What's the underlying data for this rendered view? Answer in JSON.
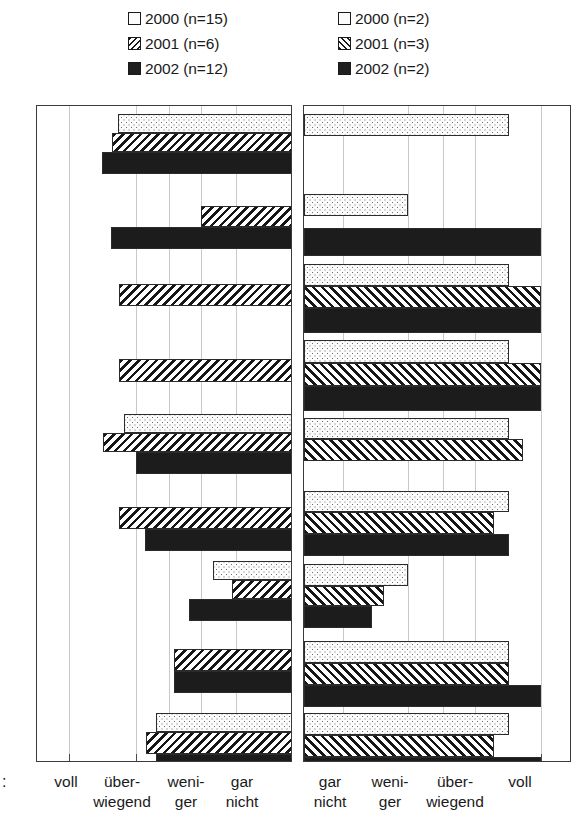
{
  "legend": {
    "left": [
      {
        "label": "2000 (n=15)",
        "pattern": "dotted"
      },
      {
        "label": "2001 (n=6)",
        "pattern": "hatch-left"
      },
      {
        "label": "2002 (n=12)",
        "pattern": "solid-black"
      }
    ],
    "right": [
      {
        "label": "2000 (n=2)",
        "pattern": "dotted"
      },
      {
        "label": "2001 (n=3)",
        "pattern": "hatch-right"
      },
      {
        "label": "2002 (n=2)",
        "pattern": "solid-black"
      }
    ]
  },
  "row_marker": ":",
  "axis": {
    "left_panel_labels": [
      {
        "line1": "voll",
        "line2": ""
      },
      {
        "line1": "über-",
        "line2": "wiegend"
      },
      {
        "line1": "weni-",
        "line2": "ger"
      },
      {
        "line1": "gar",
        "line2": "nicht"
      }
    ],
    "right_panel_labels": [
      {
        "line1": "gar",
        "line2": "nicht"
      },
      {
        "line1": "weni-",
        "line2": "ger"
      },
      {
        "line1": "über-",
        "line2": "wiegend"
      },
      {
        "line1": "voll",
        "line2": ""
      }
    ]
  },
  "colors": {
    "frame": "#3a3a3a",
    "gridline": "#c9c9c9",
    "bar_outline": "#2b2b2b",
    "solid_fill": "#1c1c1c",
    "background": "#ffffff"
  },
  "chart_data": {
    "type": "bar",
    "title": "",
    "subtitle": "",
    "xlabel": "",
    "ylabel": "",
    "orientation": "horizontal",
    "grid": true,
    "legend_position": "top",
    "panels": [
      {
        "name": "left-panel",
        "direction": "right-to-left",
        "scale_categories": [
          "voll",
          "überwiegend",
          "weniger",
          "gar nicht"
        ],
        "xlim": [
          0,
          4
        ],
        "note": "Bars anchored at right edge (value 4 = 'gar nicht' side); longer bar = value closer to 'voll'.",
        "series": [
          {
            "name": "2000 (n=15)",
            "pattern": "dotted",
            "values": [
              2.65,
              null,
              null,
              null,
              2.95,
              2.55,
              1.55,
              null,
              2.45
            ]
          },
          {
            "name": "2001 (n=6)",
            "pattern": "hatch-left",
            "values": [
              2.8,
              3.1,
              2.75,
              2.7,
              3.15,
              2.85,
              1.8,
              2.4,
              2.6
            ]
          },
          {
            "name": "2002 (n=12)",
            "pattern": "solid-black",
            "values": [
              3.0,
              2.55,
              null,
              null,
              2.55,
              2.7,
              2.1,
              2.5,
              2.6
            ]
          }
        ]
      },
      {
        "name": "right-panel",
        "direction": "left-to-right",
        "scale_categories": [
          "gar nicht",
          "weniger",
          "überwiegend",
          "voll"
        ],
        "xlim": [
          0,
          4
        ],
        "note": "Bars anchored at left edge (value 0 = 'gar nicht'); longer bar = value closer to 'voll'.",
        "series": [
          {
            "name": "2000 (n=2)",
            "pattern": "dotted",
            "values": [
              3.05,
              1.55,
              3.05,
              3.05,
              3.05,
              3.05,
              0.4,
              3.2,
              3.05
            ]
          },
          {
            "name": "2001 (n=3)",
            "pattern": "hatch-right",
            "values": [
              null,
              null,
              3.75,
              3.75,
              3.3,
              2.85,
              0.9,
              3.05,
              2.9
            ]
          },
          {
            "name": "2002 (n=2)",
            "pattern": "solid-black",
            "values": [
              null,
              3.75,
              3.75,
              3.7,
              null,
              3.05,
              0.75,
              3.85,
              3.8
            ]
          }
        ]
      }
    ],
    "group_count": 9
  },
  "geometry": {
    "left_panel": {
      "x": 36,
      "y": 105,
      "w": 256,
      "h": 657,
      "gridlines": [
        32,
        99,
        132,
        164,
        199
      ],
      "ticks": [
        32,
        99,
        132,
        164,
        199,
        231
      ]
    },
    "right_panel": {
      "x": 303,
      "y": 105,
      "w": 268,
      "h": 657,
      "gridlines": [
        39,
        104,
        139,
        171,
        237
      ],
      "ticks": [
        39,
        72,
        104,
        139,
        171,
        237
      ]
    },
    "left_bars": [
      {
        "y": 8,
        "h": 19,
        "x": 81,
        "w": 174,
        "p": "dot"
      },
      {
        "y": 27,
        "h": 19,
        "x": 75,
        "w": 180,
        "p": "hatchL"
      },
      {
        "y": 46,
        "h": 22,
        "x": 65,
        "w": 190,
        "p": "solid"
      },
      {
        "y": 100,
        "h": 21,
        "x": 164,
        "w": 91,
        "p": "hatchL",
        "shift": true
      },
      {
        "y": 121,
        "h": 22,
        "x": 74,
        "w": 181,
        "p": "solid",
        "note": "start x=74"
      },
      {
        "y": 178,
        "h": 22,
        "x": 82,
        "w": 173,
        "p": "hatchL"
      },
      {
        "y": 253,
        "h": 23,
        "x": 82,
        "w": 173,
        "p": "hatchL"
      },
      {
        "y": 308,
        "h": 19,
        "x": 87,
        "w": 168,
        "p": "dot"
      },
      {
        "y": 327,
        "h": 19,
        "x": 66,
        "w": 189,
        "p": "hatchL"
      },
      {
        "y": 346,
        "h": 22,
        "x": 99,
        "w": 156,
        "p": "solid"
      },
      {
        "y": 401,
        "h": 22,
        "x": 82,
        "w": 173,
        "p": "hatchL"
      },
      {
        "y": 423,
        "h": 22,
        "x": 108,
        "w": 147,
        "p": "solid"
      },
      {
        "y": 455,
        "h": 19,
        "x": 176,
        "w": 79,
        "p": "dot"
      },
      {
        "y": 474,
        "h": 19,
        "x": 195,
        "w": 60,
        "p": "hatchL"
      },
      {
        "y": 493,
        "h": 22,
        "x": 152,
        "w": 103,
        "p": "solid"
      },
      {
        "y": 543,
        "h": 22,
        "x": 137,
        "w": 118,
        "p": "hatchL"
      },
      {
        "y": 565,
        "h": 22,
        "x": 137,
        "w": 118,
        "p": "solid"
      },
      {
        "y": 607,
        "h": 19,
        "x": 119,
        "w": 136,
        "p": "dot"
      },
      {
        "y": 626,
        "h": 22,
        "x": 109,
        "w": 146,
        "p": "hatchL"
      },
      {
        "y": 648,
        "h": 22,
        "x": 119,
        "w": 136,
        "p": "solid"
      }
    ],
    "right_bars": [
      {
        "y": 8,
        "h": 22,
        "x": 0,
        "w": 205,
        "p": "dot"
      },
      {
        "y": 88,
        "h": 22,
        "x": 0,
        "w": 104,
        "p": "dot"
      },
      {
        "y": 122,
        "h": 28,
        "x": 0,
        "w": 237,
        "p": "solid"
      },
      {
        "y": 158,
        "h": 22,
        "x": 0,
        "w": 205,
        "p": "dot"
      },
      {
        "y": 180,
        "h": 22,
        "x": 0,
        "w": 237,
        "p": "hatchR"
      },
      {
        "y": 202,
        "h": 25,
        "x": 0,
        "w": 237,
        "p": "solid"
      },
      {
        "y": 234,
        "h": 23,
        "x": 0,
        "w": 205,
        "p": "dot"
      },
      {
        "y": 257,
        "h": 23,
        "x": 0,
        "w": 237,
        "p": "hatchR"
      },
      {
        "y": 280,
        "h": 25,
        "x": 0,
        "w": 237,
        "p": "solid"
      },
      {
        "y": 312,
        "h": 21,
        "x": 0,
        "w": 205,
        "p": "dot"
      },
      {
        "y": 333,
        "h": 22,
        "x": 0,
        "w": 219,
        "p": "hatchR"
      },
      {
        "y": 385,
        "h": 21,
        "x": 0,
        "w": 205,
        "p": "dot"
      },
      {
        "y": 406,
        "h": 22,
        "x": 0,
        "w": 190,
        "p": "hatchR"
      },
      {
        "y": 428,
        "h": 22,
        "x": 0,
        "w": 205,
        "p": "solid"
      },
      {
        "y": 458,
        "h": 22,
        "x": 0,
        "w": 104,
        "p": "dot"
      },
      {
        "y": 480,
        "h": 20,
        "x": 0,
        "w": 80,
        "p": "hatchR"
      },
      {
        "y": 500,
        "h": 22,
        "x": 0,
        "w": 68,
        "p": "solid"
      },
      {
        "y": 535,
        "h": 22,
        "x": 0,
        "w": 205,
        "p": "dot"
      },
      {
        "y": 557,
        "h": 22,
        "x": 0,
        "w": 205,
        "p": "hatchR"
      },
      {
        "y": 579,
        "h": 22,
        "x": 0,
        "w": 237,
        "p": "solid"
      },
      {
        "y": 607,
        "h": 22,
        "x": 0,
        "w": 205,
        "p": "dot"
      },
      {
        "y": 629,
        "h": 22,
        "x": 0,
        "w": 190,
        "p": "hatchR"
      },
      {
        "y": 651,
        "h": 24,
        "x": 0,
        "w": 237,
        "p": "solid"
      }
    ],
    "left_label_x": [
      66,
      122,
      186,
      242
    ],
    "right_label_x": [
      330,
      390,
      455,
      520
    ]
  }
}
